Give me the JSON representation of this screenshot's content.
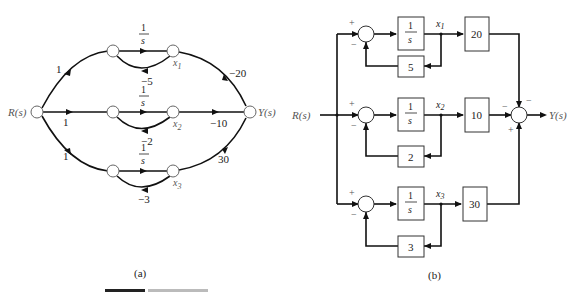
{
  "figure": {
    "caption_partial": "FIGURE",
    "panels": [
      {
        "id": "a",
        "label": "(a)",
        "type": "signal-flow-graph",
        "input": "R(s)",
        "output": "Y(s)",
        "branches": [
          {
            "state": "x1",
            "input_gain": "1",
            "integrator": "1/s",
            "feedback": "−5",
            "output_gain": "−20"
          },
          {
            "state": "x2",
            "input_gain": "1",
            "integrator": "1/s",
            "feedback": "−2",
            "output_gain": "−10"
          },
          {
            "state": "x3",
            "input_gain": "1",
            "integrator": "1/s",
            "feedback": "−3",
            "output_gain": "30"
          }
        ]
      },
      {
        "id": "b",
        "label": "(b)",
        "type": "block-diagram",
        "input": "R(s)",
        "output": "Y(s)",
        "branches": [
          {
            "state": "x1",
            "sum_signs": [
              "+",
              "−"
            ],
            "integrator": "1/s",
            "feedback_gain": "5",
            "output_gain": "20",
            "output_sign": "−"
          },
          {
            "state": "x2",
            "sum_signs": [
              "+",
              "−"
            ],
            "integrator": "1/s",
            "feedback_gain": "2",
            "output_gain": "10",
            "output_sign": "−"
          },
          {
            "state": "x3",
            "sum_signs": [
              "+",
              "−"
            ],
            "integrator": "1/s",
            "feedback_gain": "3",
            "output_gain": "30",
            "output_sign": "+"
          }
        ]
      }
    ]
  },
  "text": {
    "a_label": "(a)",
    "b_label": "(b)",
    "R": "R(s)",
    "Y": "Y(s)",
    "one": "1",
    "s": "s",
    "x": "x",
    "sub1": "1",
    "sub2": "2",
    "sub3": "3",
    "fb_a1": "−5",
    "fb_a2": "−2",
    "fb_a3": "−3",
    "out_a1": "−20",
    "out_a2": "−10",
    "out_a3": "30",
    "fb_b1": "5",
    "fb_b2": "2",
    "fb_b3": "3",
    "g_b1": "20",
    "g_b2": "10",
    "g_b3": "30",
    "plus": "+",
    "minus": "−"
  }
}
